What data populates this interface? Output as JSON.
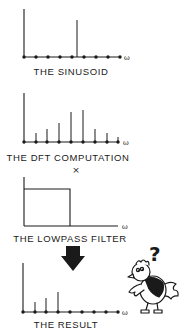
{
  "panels": [
    {
      "id": "sinusoid",
      "title": "THE SINUSOID",
      "type": "stem",
      "axis_label": "ω",
      "baseline_y": 57,
      "axis_top_y": 9,
      "x_start": 24,
      "x_end": 120,
      "label_x": 71,
      "label_y": 75,
      "dots_x": [
        24,
        36,
        48,
        60,
        72,
        84,
        96,
        108,
        120
      ],
      "stems": [
        {
          "x": 77,
          "top": 20
        }
      ]
    },
    {
      "id": "dft",
      "title": "THE DFT COMPUTATION",
      "type": "stem",
      "axis_label": "ω",
      "baseline_y": 142,
      "axis_top_y": 93,
      "x_start": 24,
      "x_end": 119,
      "label_x": 68,
      "label_y": 161,
      "dots_x": [
        24,
        36,
        47,
        59,
        71,
        83,
        95,
        107,
        118
      ],
      "stems": [
        {
          "x": 36,
          "top": 133
        },
        {
          "x": 47,
          "top": 129
        },
        {
          "x": 59,
          "top": 123
        },
        {
          "x": 71,
          "top": 112
        },
        {
          "x": 83,
          "top": 110
        },
        {
          "x": 95,
          "top": 129
        },
        {
          "x": 107,
          "top": 133
        },
        {
          "x": 118,
          "top": 137
        }
      ]
    },
    {
      "id": "lowpass",
      "title": "THE LOWPASS FILTER",
      "type": "rect",
      "axis_label": "ω",
      "baseline_y": 226,
      "axis_top_y": 177,
      "x_start": 24,
      "x_end": 118,
      "label_x": 70,
      "label_y": 242,
      "rect": {
        "x": 24,
        "top": 189,
        "right": 70
      }
    },
    {
      "id": "result",
      "title": "THE RESULT",
      "type": "stem",
      "axis_label": "ω",
      "baseline_y": 312,
      "axis_top_y": 263,
      "x_start": 23,
      "x_end": 118,
      "label_x": 66,
      "label_y": 328,
      "dots_x": [
        23,
        35,
        46,
        58,
        70,
        82,
        94,
        106,
        118
      ],
      "stems": [
        {
          "x": 35,
          "top": 302
        },
        {
          "x": 46,
          "top": 298
        },
        {
          "x": 58,
          "top": 292
        }
      ]
    }
  ],
  "operators": {
    "multiply": {
      "symbol": "×",
      "x": 76,
      "y": 173
    }
  },
  "arrow": {
    "direction": "down",
    "x": 73,
    "top": 246,
    "tip": 271
  },
  "cartoon": {
    "subject": "confused bird",
    "question_mark": "?"
  },
  "colors": {
    "ink": "#1a1a1a",
    "background": "#ffffff"
  }
}
